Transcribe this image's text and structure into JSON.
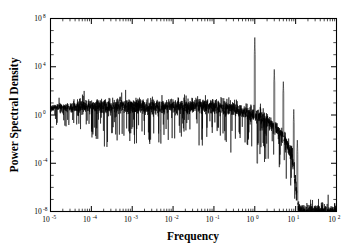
{
  "chart_data": {
    "type": "line",
    "title": "",
    "xlabel": "Frequency",
    "ylabel": "Power Spectral Density",
    "xscale": "log",
    "yscale": "log",
    "xlim": [
      1e-05,
      100.0
    ],
    "ylim": [
      1e-08,
      100000000.0
    ],
    "grid": false,
    "legend": null,
    "x_tick_labels": [
      "10⁻⁵",
      "10⁻⁴",
      "10⁻³",
      "10⁻²",
      "10⁻¹",
      "10⁰",
      "10¹",
      "10²"
    ],
    "x_tick_values": [
      1e-05,
      0.0001,
      0.001,
      0.01,
      0.1,
      1,
      10,
      100
    ],
    "x_tick_mantissas": [
      "10",
      "10",
      "10",
      "10",
      "10",
      "10",
      "10",
      "10"
    ],
    "x_tick_exponents": [
      "-5",
      "-4",
      "-3",
      "-2",
      "-1",
      "0",
      "1",
      "2"
    ],
    "y_tick_labels": [
      "10⁻⁸",
      "10⁻⁴",
      "10⁰",
      "10⁴",
      "10⁸"
    ],
    "y_tick_values": [
      1e-08,
      0.0001,
      1,
      10000.0,
      100000000.0
    ],
    "y_tick_mantissas": [
      "10",
      "10",
      "10",
      "10",
      "10"
    ],
    "y_tick_exponents": [
      "-8",
      "-4",
      "0",
      "4",
      "8"
    ],
    "series": [
      {
        "name": "Power spectral density",
        "color": "#000000",
        "plateau_level": 5.0,
        "knee_frequency": 0.25,
        "cutoff_frequency": 11.0,
        "noise_decades": 1.1,
        "x": [
          1e-05,
          0.0001,
          0.001,
          0.01,
          0.1,
          0.25,
          0.5,
          1,
          2,
          3,
          5,
          8,
          10,
          12,
          15
        ],
        "values": [
          4.0,
          5.0,
          5.0,
          5.0,
          5.0,
          4.0,
          2.0,
          1.0,
          0.35,
          0.1,
          0.02,
          0.0006,
          2e-06,
          1e-08,
          1e-08
        ]
      }
    ],
    "spikes": [
      {
        "frequency": 1.0,
        "peak": 3500000.0,
        "label": "fundamental"
      },
      {
        "frequency": 3.0,
        "peak": 7000.0,
        "label": "harmonic-3"
      },
      {
        "frequency": 5.0,
        "peak": 600.0,
        "label": "harmonic-5"
      },
      {
        "frequency": 9.0,
        "peak": 3.0,
        "label": "harmonic-9"
      },
      {
        "frequency": 11.0,
        "peak": 0.01,
        "label": "harmonic-11"
      }
    ],
    "dropouts": [
      {
        "frequency": 2.8e-05,
        "minimum": 0.25
      },
      {
        "frequency": 0.00034,
        "minimum": 0.1
      },
      {
        "frequency": 0.005,
        "minimum": 0.05
      },
      {
        "frequency": 0.12,
        "minimum": 0.05
      },
      {
        "frequency": 1.15,
        "minimum": 0.0001
      }
    ]
  }
}
